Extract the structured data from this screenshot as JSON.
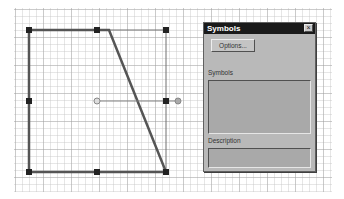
{
  "canvas": {
    "grid": {
      "minor_spacing_px": 7,
      "major_spacing_px": 28
    },
    "shape": {
      "type": "trapezoid",
      "stroke_color": "#555555",
      "points": [
        [
          29,
          30
        ],
        [
          109,
          30
        ],
        [
          166,
          172
        ],
        [
          29,
          172
        ]
      ],
      "bounding_box": {
        "x1": 29,
        "y1": 30,
        "x2": 166,
        "y2": 172
      },
      "handles": [
        [
          29,
          30
        ],
        [
          97,
          30
        ],
        [
          166,
          30
        ],
        [
          29,
          101
        ],
        [
          166,
          101
        ],
        [
          29,
          172
        ],
        [
          97,
          172
        ],
        [
          166,
          172
        ]
      ],
      "rotation_center": [
        97,
        101
      ],
      "rotation_handle": [
        178,
        101
      ]
    }
  },
  "dialog": {
    "title": "Symbols",
    "close_icon": "×",
    "options_button": "Options...",
    "symbols_label": "Symbols",
    "description_label": "Description"
  }
}
